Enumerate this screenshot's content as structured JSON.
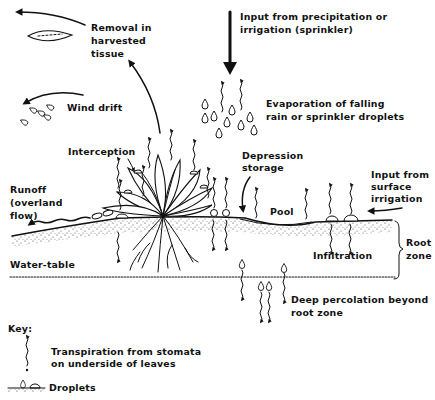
{
  "labels": {
    "precipitation_input": [
      "Input from precipitation or",
      "irrigation (sprinkler)"
    ],
    "removal_harvest": [
      "Removal in",
      "harvested",
      "tissue"
    ],
    "wind_drift": "Wind drift",
    "evaporation": [
      "Evaporation of falling",
      "rain or sprinkler droplets"
    ],
    "interception": "Interception",
    "depression_storage": [
      "Depression",
      "storage"
    ],
    "surface_irrigation": [
      "Input from",
      "surface",
      "irrigation"
    ],
    "runoff": [
      "Runoff",
      "(overland",
      "flow)"
    ],
    "pool": "Pool",
    "infiltration": "Infiltration",
    "root_zone": [
      "Root",
      "zone"
    ],
    "water_table": "Water-table",
    "deep_percolation": [
      "Deep percolation beyond",
      "root zone"
    ]
  },
  "key": {
    "title": "Key:",
    "items": [
      {
        "symbol": "transpiration-arrow",
        "label": [
          "Transpiration from stomata",
          "on underside of leaves"
        ]
      },
      {
        "symbol": "droplets",
        "label": [
          "Droplets"
        ]
      }
    ]
  },
  "colors": {
    "ink": "#111111",
    "background": "#ffffff"
  }
}
